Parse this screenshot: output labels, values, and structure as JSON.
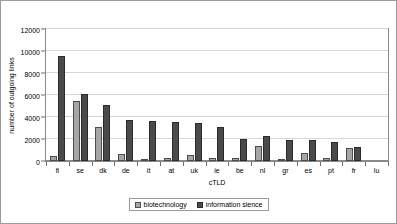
{
  "chart_data": {
    "type": "bar",
    "title": "",
    "xlabel": "cTLD",
    "ylabel": "number of outgoing links",
    "ylim": [
      0,
      12000
    ],
    "ytick_values": [
      0,
      2000,
      4000,
      6000,
      8000,
      10000,
      12000
    ],
    "ytick_labels": [
      "0",
      "2000",
      "4000",
      "6000",
      "8000",
      "10000",
      "12000"
    ],
    "grid": true,
    "legend_position": "bottom",
    "categories": [
      "fi",
      "se",
      "dk",
      "de",
      "it",
      "at",
      "uk",
      "ie",
      "be",
      "nl",
      "gr",
      "es",
      "pt",
      "fr",
      "lu"
    ],
    "series": [
      {
        "name": "biotechnology",
        "color": "#a6a6a6",
        "values": [
          450,
          5500,
          3050,
          650,
          200,
          300,
          550,
          250,
          300,
          1400,
          100,
          700,
          250,
          1150,
          0
        ]
      },
      {
        "name": "information sience",
        "color": "#4a4a4a",
        "values": [
          9550,
          6100,
          5050,
          3700,
          3600,
          3550,
          3450,
          3100,
          2000,
          2250,
          1900,
          1900,
          1750,
          1300,
          0
        ]
      }
    ]
  },
  "legend": {
    "items": [
      {
        "label": "biotechnology"
      },
      {
        "label": "information sience"
      }
    ]
  },
  "axes": {
    "y_title": "number of outgoing links",
    "x_title": "cTLD"
  }
}
